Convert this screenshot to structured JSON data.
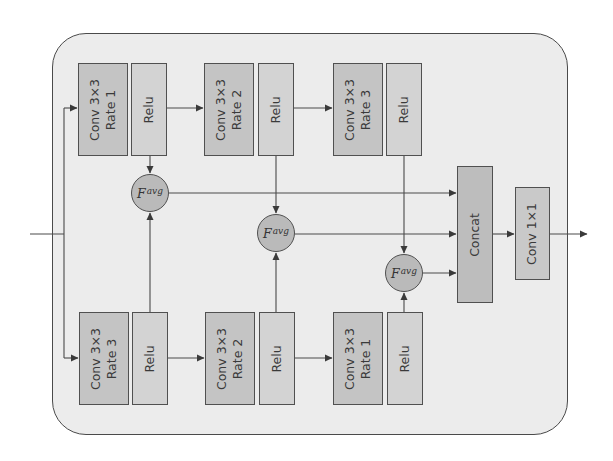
{
  "diagram": {
    "colors": {
      "container_fill": "#ececec",
      "container_stroke": "#4a4a4a",
      "conv_fill": "#c4c4c4",
      "relu_fill": "#d3d3d3",
      "fusion_fill": "#bababa",
      "concat_fill": "#bdbdbd",
      "line": "#4a4a4a"
    },
    "top_branch": [
      {
        "conv_line1": "Conv 3×3",
        "conv_line2": "Rate 1",
        "act": "Relu"
      },
      {
        "conv_line1": "Conv 3×3",
        "conv_line2": "Rate 2",
        "act": "Relu"
      },
      {
        "conv_line1": "Conv 3×3",
        "conv_line2": "Rate 3",
        "act": "Relu"
      }
    ],
    "bottom_branch": [
      {
        "conv_line1": "Conv 3×3",
        "conv_line2": "Rate 3",
        "act": "Relu"
      },
      {
        "conv_line1": "Conv 3×3",
        "conv_line2": "Rate 2",
        "act": "Relu"
      },
      {
        "conv_line1": "Conv 3×3",
        "conv_line2": "Rate 1",
        "act": "Relu"
      }
    ],
    "fusion_nodes": [
      {
        "base": "F",
        "sup": "avg"
      },
      {
        "base": "F",
        "sup": "avg"
      },
      {
        "base": "F",
        "sup": "avg"
      }
    ],
    "concat_label": "Concat",
    "final_conv_label": "Conv 1×1"
  }
}
